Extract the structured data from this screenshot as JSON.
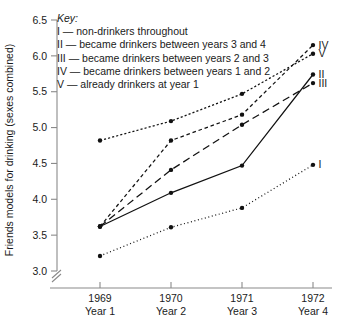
{
  "legend": {
    "title": "Key:",
    "entries": [
      "I — non-drinkers throughout",
      "II — became drinkers between years 3 and 4",
      "III — became drinkers between years 2 and 3",
      "IV — became drinkers between years 1 and 2",
      "V — already drinkers at year 1"
    ]
  },
  "axis": {
    "ylabel": "Friends models for drinking (sexes combined)",
    "ytick_labels": [
      "3.0",
      "3.5",
      "4.0",
      "4.5",
      "5.0",
      "5.5",
      "6.0",
      "6.5"
    ],
    "xtick_years": [
      "1969",
      "1970",
      "1971",
      "1972"
    ],
    "xtick_sublabels": [
      "Year 1",
      "Year 2",
      "Year 3",
      "Year 4"
    ]
  },
  "end_labels": [
    "IV",
    "V",
    "II",
    "III",
    "I"
  ],
  "chart_data": {
    "type": "line",
    "title": "",
    "xlabel": "",
    "ylabel": "Friends models for drinking (sexes combined)",
    "x": [
      "1969",
      "1970",
      "1971",
      "1972"
    ],
    "x_sublabels": [
      "Year 1",
      "Year 2",
      "Year 3",
      "Year 4"
    ],
    "ylim": [
      3.0,
      6.5
    ],
    "ytick_step": 0.5,
    "yaxis_break_below": 3.0,
    "grid": false,
    "legend_position": "top-left-inside",
    "series": [
      {
        "name": "I",
        "label": "I — non-drinkers throughout",
        "line_style": "dotted",
        "values": [
          3.21,
          3.61,
          3.88,
          4.48
        ],
        "end_label": "I"
      },
      {
        "name": "II",
        "label": "II — became drinkers between years 3 and 4",
        "line_style": "solid",
        "values": [
          3.62,
          4.09,
          4.47,
          5.74
        ],
        "end_label": "II"
      },
      {
        "name": "III",
        "label": "III — became drinkers between years 2 and 3",
        "line_style": "long-dash",
        "values": [
          3.62,
          4.41,
          5.04,
          5.62
        ],
        "end_label": "III"
      },
      {
        "name": "IV",
        "label": "IV — became drinkers between years 1 and 2",
        "line_style": "short-dash",
        "values": [
          3.62,
          4.82,
          5.18,
          6.15
        ],
        "end_label": "IV"
      },
      {
        "name": "V",
        "label": "V — already drinkers at year 1",
        "line_style": "fine-dash",
        "values": [
          4.82,
          5.09,
          5.47,
          6.03
        ],
        "end_label": "V"
      }
    ]
  }
}
